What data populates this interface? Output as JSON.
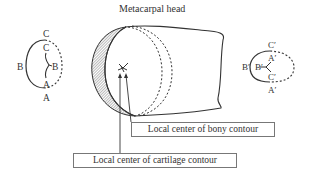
{
  "diagram": {
    "title": "Metacarpal head",
    "callouts": {
      "bony": "Local center of bony contour",
      "cartilage": "Local center of cartilage contour"
    },
    "left_contour": {
      "outer_labels": {
        "top": "C",
        "left": "B",
        "bottom": "A"
      },
      "inner_labels": {
        "top": "C",
        "right": "B",
        "bottom": "A"
      }
    },
    "right_contour": {
      "outer_labels": {
        "top": "C′",
        "left": "B′",
        "bottom": "A′"
      },
      "inner_labels": {
        "top": "A′",
        "left": "B′",
        "bottom": "C′"
      }
    },
    "colors": {
      "line": "#333333",
      "hatch": "#555555",
      "box_border": "#777777"
    }
  }
}
